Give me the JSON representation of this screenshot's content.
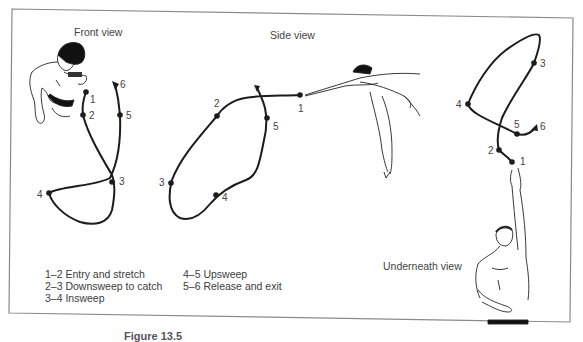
{
  "figure": {
    "frame_color": "#8a8a8a",
    "path_color": "#1c1c1c",
    "caption_partial": "Figure 13.5"
  },
  "views": {
    "front": {
      "title": "Front view",
      "points": [
        {
          "id": "1",
          "label": "1"
        },
        {
          "id": "2",
          "label": "2"
        },
        {
          "id": "3",
          "label": "3"
        },
        {
          "id": "4",
          "label": "4"
        },
        {
          "id": "5",
          "label": "5"
        },
        {
          "id": "6",
          "label": "6"
        }
      ]
    },
    "side": {
      "title": "Side view",
      "points": [
        {
          "id": "1",
          "label": "1"
        },
        {
          "id": "2",
          "label": "2"
        },
        {
          "id": "3",
          "label": "3"
        },
        {
          "id": "4",
          "label": "4"
        },
        {
          "id": "5",
          "label": "5"
        }
      ]
    },
    "underneath": {
      "title": "Underneath view",
      "points": [
        {
          "id": "1",
          "label": "1"
        },
        {
          "id": "2",
          "label": "2"
        },
        {
          "id": "3",
          "label": "3"
        },
        {
          "id": "4",
          "label": "4"
        },
        {
          "id": "5",
          "label": "5"
        },
        {
          "id": "6",
          "label": "6"
        }
      ]
    }
  },
  "legend": {
    "left": [
      "1–2 Entry and stretch",
      "2–3 Downsweep to catch",
      "3–4 Insweep"
    ],
    "right": [
      "4–5 Upsweep",
      "5–6 Release and exit"
    ]
  }
}
